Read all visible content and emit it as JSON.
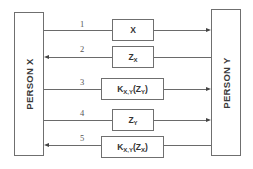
{
  "parties": {
    "left": {
      "label": "PERSON X"
    },
    "right": {
      "label": "PERSON Y"
    }
  },
  "messages": [
    {
      "step": "1",
      "base": "X",
      "sub": "",
      "suffix": "",
      "direction": "X_to_Y"
    },
    {
      "step": "2",
      "base": "Z",
      "sub": "X",
      "suffix": "",
      "direction": "Y_to_X"
    },
    {
      "step": "3",
      "base": "K",
      "sub": "X,Y",
      "suffix": "(Z",
      "sub2": "Y",
      "close": ")",
      "direction": "X_to_Y"
    },
    {
      "step": "4",
      "base": "Z",
      "sub": "Y",
      "suffix": "",
      "direction": "X_to_Y"
    },
    {
      "step": "5",
      "base": "K",
      "sub": "X,Y",
      "suffix": "(Z",
      "sub2": "X",
      "close": ")",
      "direction": "Y_to_X"
    }
  ]
}
